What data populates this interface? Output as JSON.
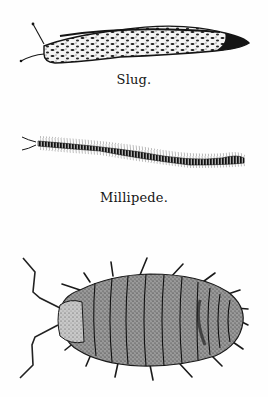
{
  "figures": [
    {
      "name": "slug",
      "caption": "Slug."
    },
    {
      "name": "millipede",
      "caption": "Millipede."
    },
    {
      "name": "woodlouse",
      "caption": ""
    }
  ],
  "colors": {
    "ink": "#151515",
    "paper": "#fefefe",
    "stipple": "#3a3a3a"
  }
}
